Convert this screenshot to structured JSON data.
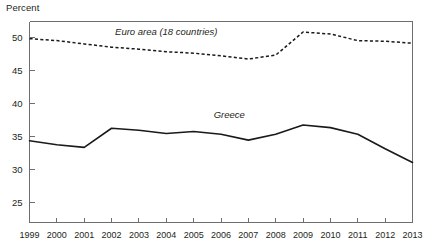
{
  "chart_data": {
    "type": "line",
    "title": "",
    "subtitle": "",
    "xlabel": "",
    "ylabel": "Percent",
    "ylim": [
      22,
      52.5
    ],
    "xlim": [
      1999,
      2013
    ],
    "grid": false,
    "legend_position": "inline-annotation",
    "yticks": [
      25,
      30,
      35,
      40,
      45,
      50
    ],
    "ytick_labels": [
      "25",
      "30",
      "35",
      "40",
      "45",
      "50"
    ],
    "x": [
      1999,
      2000,
      2001,
      2002,
      2003,
      2004,
      2005,
      2006,
      2007,
      2008,
      2009,
      2010,
      2011,
      2012,
      2013
    ],
    "xtick_labels": [
      "1999",
      "2000",
      "2001",
      "2002",
      "2003",
      "2004",
      "2005",
      "2006",
      "2007",
      "2008",
      "2009",
      "2010",
      "2011",
      "2012",
      "2013"
    ],
    "series": [
      {
        "name": "Euro area (18 countries)",
        "style": "dashed",
        "color": "#1a1a1a",
        "label_text": "Euro area (18 countries)",
        "values": [
          49.9,
          49.6,
          49.1,
          48.6,
          48.3,
          47.9,
          47.7,
          47.3,
          46.8,
          47.4,
          50.9,
          50.6,
          49.6,
          49.5,
          49.2
        ]
      },
      {
        "name": "Greece",
        "style": "solid",
        "color": "#1a1a1a",
        "label_text": "Greece",
        "values": [
          34.4,
          33.8,
          33.4,
          36.3,
          36.0,
          35.5,
          35.8,
          35.4,
          34.5,
          35.4,
          36.8,
          36.4,
          35.4,
          33.2,
          31.1
        ]
      }
    ],
    "annotations": [
      {
        "text": "Euro area (18 countries)",
        "x": 2004.0,
        "y": 50.4
      },
      {
        "text": "Greece",
        "x": 2006.3,
        "y": 37.8
      }
    ]
  }
}
